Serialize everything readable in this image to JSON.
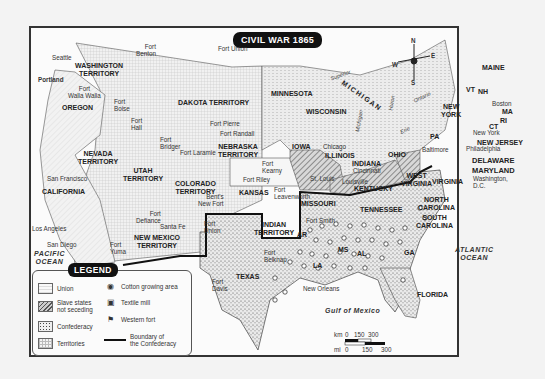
{
  "title": "CIVIL WAR 1865",
  "compass": {
    "n": "N",
    "s": "S",
    "e": "E",
    "w": "W"
  },
  "regions": {
    "washington": "WASHINGTON\nTERRITORY",
    "oregon": "OREGON",
    "california": "CALIFORNIA",
    "nevada": "NEVADA\nTERRITORY",
    "utah": "UTAH\nTERRITORY",
    "colorado": "COLORADO\nTERRITORY",
    "new_mexico": "NEW MEXICO\nTERRITORY",
    "dakota": "DAKOTA TERRITORY",
    "nebraska": "NEBRASKA\nTERRITORY",
    "kansas": "KANSAS",
    "indian": "INDIAN\nTERRITORY",
    "texas": "TEXAS",
    "minnesota": "MINNESOTA",
    "iowa": "IOWA",
    "missouri": "MISSOURI",
    "wisconsin": "WISCONSIN",
    "michigan": "MICHIGAN",
    "illinois": "ILLINOIS",
    "indiana": "INDIANA",
    "ohio": "OHIO",
    "kentucky": "KENTUCKY",
    "tennessee": "TENNESSEE",
    "west_virginia": "WEST\nVIRGINIA",
    "virginia": "VIRGINIA",
    "north_carolina": "NORTH\nCAROLINA",
    "south_carolina": "SOUTH\nCAROLINA",
    "ar": "AR",
    "la": "LA",
    "ms": "MS",
    "al": "AL",
    "ga": "GA",
    "florida": "FLORIDA",
    "pa": "PA",
    "new_york": "NEW\nYORK",
    "vt": "VT",
    "nh": "NH",
    "maine": "MAINE",
    "ma": "MA",
    "ri": "RI",
    "ct": "CT",
    "new_jersey": "NEW JERSEY",
    "delaware": "DELAWARE",
    "maryland": "MARYLAND"
  },
  "cities": {
    "seattle": "Seattle",
    "portland": "Portland",
    "san_francisco": "San Francisco",
    "los_angeles": "Los Angeles",
    "san_diego": "San Diego",
    "santa_fe": "Santa Fe",
    "chicago": "Chicago",
    "st_louis": "St. Louis",
    "cincinnati": "Cincinnati",
    "louisville": "Louisville",
    "new_orleans": "New Orleans",
    "baltimore": "Baltimore",
    "philadelphia": "Philadelphia",
    "new_york": "New York",
    "boston": "Boston",
    "washington_dc": "Washington,\nD.C."
  },
  "forts": {
    "benton": "Fort\nBenton",
    "union_n": "Fort Union",
    "walla_walla": "Fort\nWalla Walla",
    "boise": "Fort\nBoise",
    "hall": "Fort\nHall",
    "pierre": "Fort Pierre",
    "randall": "Fort Randall",
    "bridger": "Fort\nBridger",
    "laramie": "Fort Laramie",
    "kearny": "Fort\nKearny",
    "riley": "Fort Riley",
    "leavenworth": "Fort\nLeavenworth",
    "bents": "Bent's\nNew Fort",
    "defiance": "Fort\nDefiance",
    "union_nm": "Fort\nUnion",
    "yuma": "Fort\nYuma",
    "smith": "Fort Smith",
    "belknap": "Fort\nBelknap",
    "davis": "Fort\nDavis"
  },
  "water": {
    "pacific": "PACIFIC\nOCEAN",
    "atlantic": "ATLANTIC\nOCEAN",
    "gulf": "Gulf of Mexico",
    "superior": "Superior",
    "michigan_lake": "Michigan",
    "huron": "Huron",
    "erie": "Erie",
    "ontario": "Ontario"
  },
  "legend": {
    "title": "LEGEND",
    "items": [
      {
        "label": "Union",
        "swatch": "union"
      },
      {
        "label": "Slave states\nnot seceding",
        "swatch": "slave"
      },
      {
        "label": "Confederacy",
        "swatch": "confederacy"
      },
      {
        "label": "Territories",
        "swatch": "territories"
      },
      {
        "label": "Cotton growing area",
        "icon": "cotton-icon"
      },
      {
        "label": "Textile mill",
        "icon": "textile-mill-icon"
      },
      {
        "label": "Western fort",
        "icon": "fort-icon"
      },
      {
        "label": "Boundary of\nthe Confederacy",
        "icon": "boundary-line"
      }
    ]
  },
  "scale": {
    "km_label": "km",
    "km_ticks": [
      "0",
      "150",
      "300"
    ],
    "mi_label": "mi",
    "mi_ticks": [
      "0",
      "150",
      "300"
    ]
  }
}
